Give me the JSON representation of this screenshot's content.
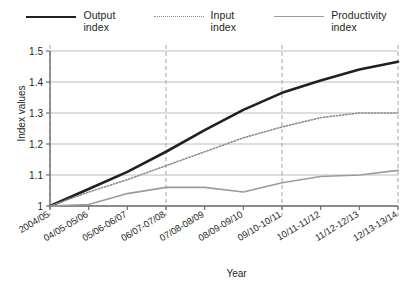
{
  "chart_data": {
    "type": "line",
    "title": "",
    "xlabel": "Year",
    "ylabel": "Index values",
    "ylim": [
      1,
      1.5
    ],
    "yticks": [
      "1",
      "1.1",
      "1.2",
      "1.3",
      "1.4",
      "1.5"
    ],
    "ytick_values": [
      1,
      1.1,
      1.2,
      1.3,
      1.4,
      1.5
    ],
    "grid": "horizontal solid gridlines plus dashed vertical gridlines at 2004/05, 06/07-07/08, 09/10-10/11 and 12/13-13/14",
    "legend_position": "top-center",
    "categories": [
      "2004/05",
      "04/05-05/06",
      "05/06-06/07",
      "06/07-07/08",
      "07/08-08/09",
      "08/09-09/10",
      "09/10-10/11",
      "10/11-11/12",
      "11/12-12/13",
      "12/13-13/14"
    ],
    "series": [
      {
        "name": "Output\nindex",
        "label_line1": "Output",
        "label_line2": "index",
        "color": "#231f20",
        "style": "solid",
        "width": 2.6,
        "values": [
          1.0,
          1.055,
          1.11,
          1.175,
          1.245,
          1.31,
          1.365,
          1.405,
          1.44,
          1.465
        ]
      },
      {
        "name": "Input\nindex",
        "label_line1": "Input",
        "label_line2": "index",
        "color": "#8d8d8d",
        "style": "dotted",
        "width": 1.6,
        "values": [
          1.0,
          1.045,
          1.085,
          1.13,
          1.175,
          1.22,
          1.255,
          1.285,
          1.3,
          1.3
        ]
      },
      {
        "name": "Productivity\nindex",
        "label_line1": "Productivity",
        "label_line2": "index",
        "color": "#9b9b9b",
        "style": "solid",
        "width": 1.6,
        "values": [
          1.0,
          1.005,
          1.04,
          1.06,
          1.06,
          1.045,
          1.075,
          1.095,
          1.1,
          1.115
        ]
      }
    ]
  },
  "axis": {
    "y_title": "Index values",
    "x_title": "Year"
  }
}
